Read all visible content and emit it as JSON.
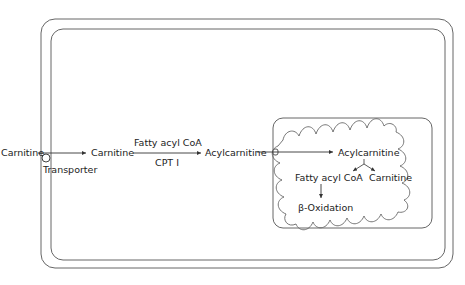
{
  "diagram": {
    "type": "carnitine shuttle",
    "colors": {
      "line": "#555555",
      "text": "#222222",
      "background": "#ffffff"
    },
    "labels": {
      "carnitine_outside": "Carnitine",
      "transporter": "Transporter",
      "carnitine_cytosol": "Carnitine",
      "fatty_acyl_coa_top": "Fatty acyl CoA",
      "cpt1": "CPT I",
      "acylcarnitine_cytosol": "Acylcarnitine",
      "acylcarnitine_matrix": "Acylcarnitine",
      "fatty_acyl_coa_matrix": "Fatty acyl CoA",
      "carnitine_matrix": "Carnitine",
      "beta_oxidation": "β-Oxidation"
    },
    "compartments": [
      "outside cell",
      "cell membrane (double)",
      "cytosol",
      "mitochondrion",
      "mitochondrial matrix (cristae)"
    ]
  }
}
